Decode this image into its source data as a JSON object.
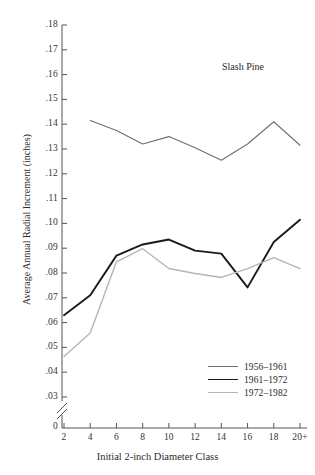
{
  "chart_data": {
    "type": "line",
    "title": "",
    "annotation": "Slash Pine",
    "xlabel": "Initial 2-inch Diameter Class",
    "ylabel": "Average Annual Radial Increment (inches)",
    "categories": [
      "2",
      "4",
      "6",
      "8",
      "10",
      "12",
      "14",
      "16",
      "18",
      "20+"
    ],
    "x_tick_labels": [
      "2",
      "4",
      "6",
      "8",
      "10",
      "12",
      "14",
      "16",
      "18",
      "20+"
    ],
    "y_tick_labels": [
      "0",
      ".03",
      ".04",
      ".05",
      ".06",
      ".07",
      ".08",
      ".09",
      ".10",
      ".11",
      ".12",
      ".13",
      ".14",
      ".15",
      ".16",
      ".17",
      ".18"
    ],
    "ylim": [
      0.03,
      0.18
    ],
    "y_axis_break": true,
    "y_axis_break_label": "0",
    "grid": false,
    "legend_position": "lower-right",
    "series": [
      {
        "name": "1956–1961",
        "color": "#6f6f6f",
        "width": 1.1,
        "x": [
          "4",
          "6",
          "8",
          "10",
          "12",
          "14",
          "16",
          "18",
          "20+"
        ],
        "values": [
          0.1415,
          0.1375,
          0.132,
          0.135,
          0.1305,
          0.1255,
          0.132,
          0.141,
          0.1315
        ]
      },
      {
        "name": "1961–1972",
        "color": "#1a1a1a",
        "width": 1.9,
        "x": [
          "2",
          "4",
          "6",
          "8",
          "10",
          "12",
          "14",
          "16",
          "18",
          "20+"
        ],
        "values": [
          0.063,
          0.071,
          0.087,
          0.0915,
          0.0935,
          0.089,
          0.0878,
          0.0742,
          0.0925,
          0.1015
        ]
      },
      {
        "name": "1972–1982",
        "color": "#b5b5b5",
        "width": 1.4,
        "x": [
          "2",
          "4",
          "6",
          "8",
          "10",
          "12",
          "14",
          "16",
          "18",
          "20+"
        ],
        "values": [
          0.0463,
          0.0558,
          0.0845,
          0.0898,
          0.0818,
          0.0798,
          0.0782,
          0.0818,
          0.0862,
          0.0818
        ]
      }
    ]
  },
  "legend": {
    "items": [
      {
        "label": "1956–1961"
      },
      {
        "label": "1961–1972"
      },
      {
        "label": "1972–1982"
      }
    ]
  },
  "colors": {
    "series_1956_1961": "#6f6f6f",
    "series_1961_1972": "#1a1a1a",
    "series_1972_1982": "#b5b5b5",
    "axis": "#555555",
    "text": "#2b2b2b",
    "background": "#ffffff"
  }
}
